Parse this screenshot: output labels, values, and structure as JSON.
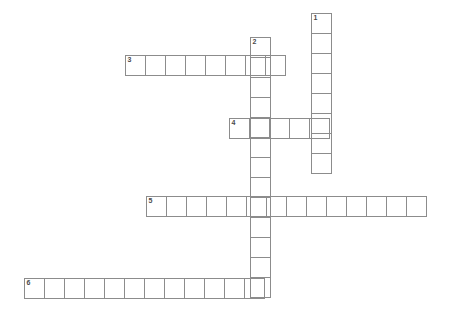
{
  "puzzle": {
    "title": "Crossword Puzzle Grid",
    "cell_size_px": 21,
    "grid_line_color": "#8c8c8c",
    "background_color": "#ffffff",
    "number_color": "#4a4a4a",
    "entries": [
      {
        "number": "1",
        "direction": "down",
        "length": 8,
        "x": 311,
        "y": 13,
        "cells": [
          "",
          "",
          "",
          "",
          "",
          "",
          "",
          ""
        ]
      },
      {
        "number": "2",
        "direction": "down",
        "length": 13,
        "x": 250,
        "y": 37,
        "cells": [
          "",
          "",
          "",
          "",
          "",
          "",
          "",
          "",
          "",
          "",
          "",
          "",
          ""
        ]
      },
      {
        "number": "3",
        "direction": "across",
        "length": 8,
        "x": 125,
        "y": 55,
        "cells": [
          "",
          "",
          "",
          "",
          "",
          "",
          "",
          ""
        ]
      },
      {
        "number": "4",
        "direction": "across",
        "length": 5,
        "x": 229,
        "y": 118,
        "cells": [
          "",
          "",
          "",
          "",
          ""
        ]
      },
      {
        "number": "5",
        "direction": "across",
        "length": 14,
        "x": 146,
        "y": 196,
        "cells": [
          "",
          "",
          "",
          "",
          "",
          "",
          "",
          "",
          "",
          "",
          "",
          "",
          "",
          ""
        ]
      },
      {
        "number": "6",
        "direction": "across",
        "length": 12,
        "x": 24,
        "y": 278,
        "cells": [
          "",
          "",
          "",
          "",
          "",
          "",
          "",
          "",
          "",
          "",
          "",
          ""
        ]
      }
    ]
  }
}
